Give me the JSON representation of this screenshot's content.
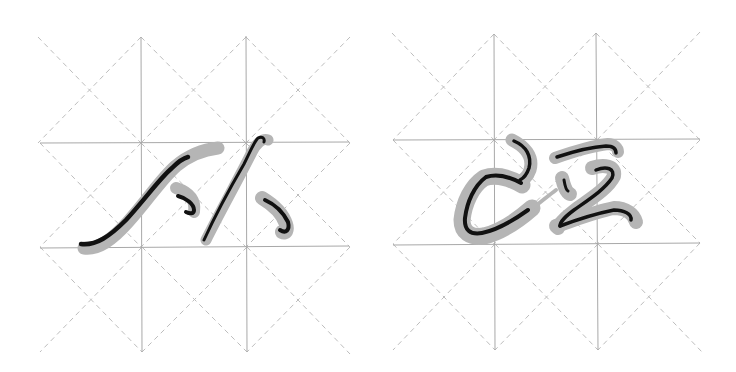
{
  "image": {
    "description": "Two practice grids (米字格-style with dashed cell diagonals) each showing cursive calligraphy characters with black core strokes over gray brush halos",
    "colors": {
      "background": "#ffffff",
      "grid_solid": "#a8a8a8",
      "grid_dashed": "#bdbdbd",
      "stroke_halo": "#b5b5b5",
      "stroke_core": "#111111"
    }
  },
  "panels": [
    {
      "name": "left-panel",
      "label": "从",
      "grid": {
        "verticals_x": [
          141,
          246
        ],
        "horizontals_y": [
          143,
          247
        ],
        "bounds": {
          "x0": 38,
          "y0": 37,
          "x1": 350,
          "y1": 353
        }
      }
    },
    {
      "name": "right-panel",
      "label": "匹",
      "grid": {
        "verticals_x": [
          494,
          597
        ],
        "horizontals_y": [
          140,
          244
        ],
        "bounds": {
          "x0": 392,
          "y0": 33,
          "x1": 702,
          "y1": 350
        }
      }
    }
  ]
}
